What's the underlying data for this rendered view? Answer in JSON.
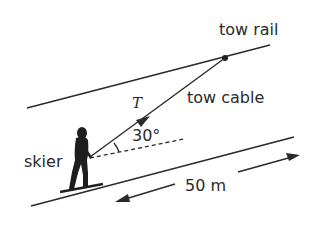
{
  "diagram": {
    "type": "physics-free-body",
    "labels": {
      "tow_rail": "tow rail",
      "tension": "T",
      "tow_cable": "tow cable",
      "angle": "30°",
      "skier": "skier",
      "distance": "50 m"
    },
    "values": {
      "angle_deg": 30,
      "distance_m": 50
    },
    "colors": {
      "line": "#2a2a2a",
      "background": "#ffffff",
      "figure": "#1e1e1e"
    }
  }
}
